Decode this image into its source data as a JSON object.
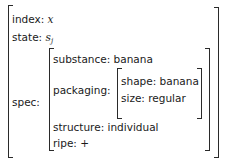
{
  "avm": {
    "index": {
      "label": "index:",
      "value": "x"
    },
    "state": {
      "label": "state:",
      "value": "s",
      "subscript": "j"
    },
    "spec": {
      "label": "spec:",
      "substance": {
        "label": "substance:",
        "value": "banana"
      },
      "packaging": {
        "label": "packaging:",
        "shape": {
          "label": "shape:",
          "value": "banana"
        },
        "size": {
          "label": "size:",
          "value": "regular"
        }
      },
      "structure": {
        "label": "structure:",
        "value": "individual"
      },
      "ripe": {
        "label": "ripe:",
        "value": "+"
      }
    }
  }
}
